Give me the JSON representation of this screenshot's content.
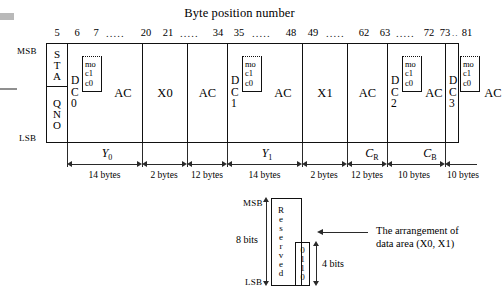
{
  "diagram": {
    "title": "Byte position number",
    "axis_labels": {
      "msb": "MSB",
      "lsb": "LSB"
    },
    "byte_numbers": [
      "5",
      "6",
      "7",
      "20",
      "21",
      "34",
      "35",
      "48",
      "49",
      "62",
      "63",
      "72",
      "73",
      "81"
    ],
    "ellipsis": ".....",
    "ellipsis_short": "..",
    "sync_cell": {
      "top": [
        "S",
        "T",
        "A"
      ],
      "bottom": [
        "Q",
        "N",
        "O"
      ]
    },
    "dc_cells": [
      {
        "name": "DC0",
        "letters": [
          "D",
          "C",
          "0"
        ]
      },
      {
        "name": "DC1",
        "letters": [
          "D",
          "C",
          "1"
        ]
      },
      {
        "name": "DC2",
        "letters": [
          "D",
          "C",
          "2"
        ]
      },
      {
        "name": "DC3",
        "letters": [
          "D",
          "C",
          "3"
        ]
      }
    ],
    "mode_box": {
      "lines": [
        "mo",
        "c1",
        "c0"
      ]
    },
    "ac_label": "AC",
    "data_cells": [
      {
        "name": "X0",
        "label": "X0"
      },
      {
        "name": "X1",
        "label": "X1"
      }
    ],
    "groups": [
      {
        "name": "Y0",
        "label": "Y",
        "sub": "0"
      },
      {
        "name": "Y1",
        "label": "Y",
        "sub": "1"
      },
      {
        "name": "CR",
        "label": "C",
        "sub": "R"
      },
      {
        "name": "CB",
        "label": "C",
        "sub": "B"
      }
    ],
    "byte_spans": [
      {
        "label": "14 bytes"
      },
      {
        "label": "2 bytes"
      },
      {
        "label": "12 bytes"
      },
      {
        "label": "14 bytes"
      },
      {
        "label": "2 bytes"
      },
      {
        "label": "12 bytes"
      },
      {
        "label": "10 bytes"
      },
      {
        "label": "10 bytes"
      }
    ]
  },
  "inset": {
    "msb": "MSB",
    "lsb": "LSB",
    "reserved_letters": [
      "R",
      "e",
      "s",
      "e",
      "r",
      "v",
      "e",
      "d"
    ],
    "bits_value": [
      "0",
      "1",
      "1",
      "0"
    ],
    "outer_bits_label": "8 bits",
    "inner_bits_label": "4 bits",
    "annotation": "The arrangement of data area (X0, X1)"
  }
}
